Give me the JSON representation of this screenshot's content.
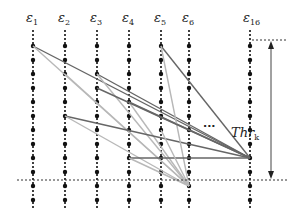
{
  "diagram": {
    "columns": [
      {
        "label": "ε",
        "sub": "1",
        "x": 33
      },
      {
        "label": "ε",
        "sub": "2",
        "x": 65
      },
      {
        "label": "ε",
        "sub": "3",
        "x": 97
      },
      {
        "label": "ε",
        "sub": "4",
        "x": 129
      },
      {
        "label": "ε",
        "sub": "5",
        "x": 161
      },
      {
        "label": "ε",
        "sub": "6",
        "x": 189
      },
      {
        "label": "ε",
        "sub": "16",
        "x": 250
      }
    ],
    "ellipsis": "...",
    "threshold_label": "Thr",
    "threshold_sub": "k",
    "colors": {
      "dark_line": "#666666",
      "light_line": "#b8b8b8",
      "dots": "#111111"
    }
  }
}
